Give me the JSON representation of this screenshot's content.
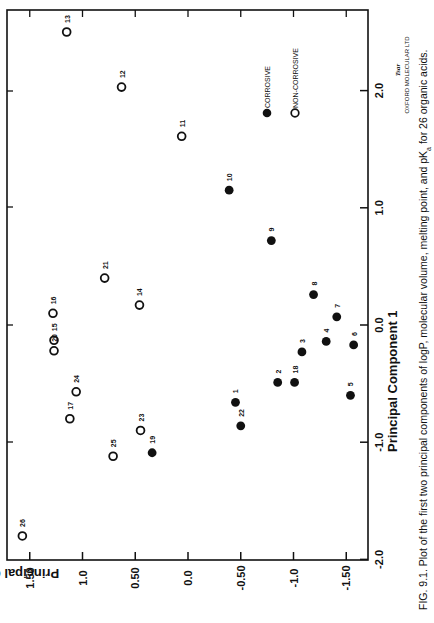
{
  "chart_data": {
    "type": "scatter",
    "orientation": "rotated 90 degrees clockwise on page (PC1 vertical along right edge, PC2 horizontal along bottom, reversed)",
    "title": "",
    "xlabel": "Principal Component 1",
    "ylabel": "Principal Component 2",
    "xlim": [
      -2.0,
      2.7
    ],
    "ylim": [
      -1.6,
      1.65
    ],
    "pc1_ticks": [
      "2.0",
      "1.0",
      "0.0",
      "-1.0",
      "-2.0"
    ],
    "pc1_tick_values": [
      2.0,
      1.0,
      0.0,
      -1.0,
      -2.0
    ],
    "pc2_ticks": [
      "1.50",
      "1.0",
      "0.50",
      "0.0",
      "-0.50",
      "-1.0",
      "-1.50"
    ],
    "pc2_tick_values": [
      1.5,
      1.0,
      0.5,
      0.0,
      -0.5,
      -1.0,
      -1.5
    ],
    "grid": false,
    "legend": {
      "position": "upper right (page)",
      "entries": [
        {
          "label": "CORROSIVE",
          "marker": "filled-circle"
        },
        {
          "label": "NON-CORROSIVE",
          "marker": "open-circle"
        }
      ]
    },
    "series": [
      {
        "name": "CORROSIVE",
        "marker": "filled-circle",
        "points": [
          {
            "id": "1",
            "pc1": -0.66,
            "pc2": -0.45
          },
          {
            "id": "2",
            "pc1": -0.49,
            "pc2": -0.85
          },
          {
            "id": "3",
            "pc1": -0.23,
            "pc2": -1.08
          },
          {
            "id": "4",
            "pc1": -0.14,
            "pc2": -1.31
          },
          {
            "id": "5",
            "pc1": -0.6,
            "pc2": -1.54
          },
          {
            "id": "6",
            "pc1": -0.17,
            "pc2": -1.57
          },
          {
            "id": "7",
            "pc1": 0.07,
            "pc2": -1.41
          },
          {
            "id": "8",
            "pc1": 0.26,
            "pc2": -1.19
          },
          {
            "id": "9",
            "pc1": 0.72,
            "pc2": -0.79
          },
          {
            "id": "10",
            "pc1": 1.15,
            "pc2": -0.39
          },
          {
            "id": "18",
            "pc1": -0.49,
            "pc2": -1.01
          },
          {
            "id": "19",
            "pc1": -1.09,
            "pc2": 0.34
          },
          {
            "id": "22",
            "pc1": -0.86,
            "pc2": -0.5
          }
        ]
      },
      {
        "name": "NON-CORROSIVE",
        "marker": "open-circle",
        "points": [
          {
            "id": "11",
            "pc1": 1.61,
            "pc2": 0.06
          },
          {
            "id": "12",
            "pc1": 2.03,
            "pc2": 0.63
          },
          {
            "id": "13",
            "pc1": 2.5,
            "pc2": 1.15
          },
          {
            "id": "14",
            "pc1": 0.17,
            "pc2": 0.46
          },
          {
            "id": "15",
            "pc1": -0.13,
            "pc2": 1.27
          },
          {
            "id": "16",
            "pc1": 0.1,
            "pc2": 1.28
          },
          {
            "id": "17",
            "pc1": -0.8,
            "pc2": 1.12
          },
          {
            "id": "20",
            "pc1": -0.22,
            "pc2": 1.27
          },
          {
            "id": "21",
            "pc1": 0.4,
            "pc2": 0.79
          },
          {
            "id": "23",
            "pc1": -0.9,
            "pc2": 0.45
          },
          {
            "id": "24",
            "pc1": -0.57,
            "pc2": 1.06
          },
          {
            "id": "25",
            "pc1": -1.12,
            "pc2": 0.71
          },
          {
            "id": "26",
            "pc1": -1.8,
            "pc2": 1.57
          }
        ]
      }
    ],
    "annotations": [
      "Tsar",
      "OXFORD MOLECULAR LTD"
    ]
  },
  "axes": {
    "pc1_title": "Principal Component 1",
    "pc2_title": "Principal Component 2"
  },
  "legend": {
    "corrosive": "CORROSIVE",
    "non_corrosive": "NON-CORROSIVE"
  },
  "logo": {
    "name": "Tsar",
    "company": "OXFORD MOLECULAR LTD"
  },
  "caption": {
    "text": "FIG. 9.1. Plot of the first two principal components of logP, molecular volume, melting point, and pK",
    "subscript": "a",
    "tail": " for 26 organic acids."
  },
  "colors": {
    "ink": "#111111",
    "background": "#ffffff"
  }
}
